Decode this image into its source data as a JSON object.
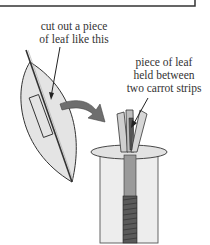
{
  "diagram": {
    "labels": {
      "cut_leaf": [
        "cut out a piece",
        "of leaf like this"
      ],
      "held_leaf": [
        "piece of leaf",
        "held between",
        "two carrot strips"
      ]
    },
    "colors": {
      "line": "#222222",
      "leaf_fill": "#e6e6e6",
      "arrow_fill": "#6e6e6e",
      "jar_fill": "#ececec",
      "thread_fill": "#5a5a5a"
    }
  }
}
